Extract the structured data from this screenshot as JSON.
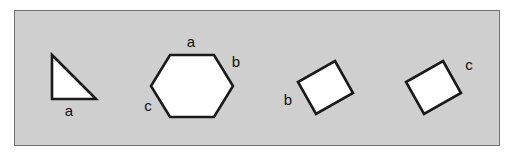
{
  "panel": {
    "background_color": "#cfcfcf",
    "border_color": "#6e6e6e",
    "page_background_color": "#ffffff"
  },
  "style": {
    "shape_fill_color": "#ffffff",
    "shape_stroke_color": "#1a1a1a",
    "label_color": "#111111"
  },
  "figure": {
    "shapes": [
      {
        "name": "right-triangle",
        "kind": "triangle",
        "points": "52,55 52,99 96,99",
        "labels": [
          {
            "text": "a",
            "x": 69,
            "y": 112
          }
        ]
      },
      {
        "name": "hexagon",
        "kind": "hexagon",
        "points": "170,55 214,55 233,86 214,117 170,117 151,86",
        "labels": [
          {
            "text": "a",
            "x": 191,
            "y": 43
          },
          {
            "text": "b",
            "x": 236,
            "y": 63
          },
          {
            "text": "c",
            "x": 148,
            "y": 107
          }
        ]
      },
      {
        "name": "rotated-rectangle-left",
        "kind": "rectangle",
        "points": "335,61 353,93 316,114 298,82",
        "labels": [
          {
            "text": "b",
            "x": 288,
            "y": 101
          }
        ]
      },
      {
        "name": "rotated-rectangle-right",
        "kind": "rectangle",
        "points": "443,61 461,93 424,114 406,82",
        "labels": [
          {
            "text": "c",
            "x": 469,
            "y": 66
          }
        ]
      }
    ]
  }
}
